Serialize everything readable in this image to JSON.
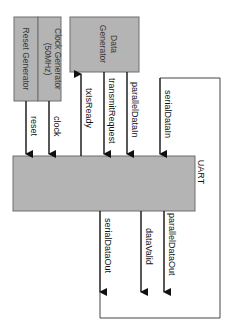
{
  "diagram": {
    "type": "block-diagram",
    "orientation": "rotated 90 degrees clockwise",
    "colors": {
      "block_fill": "#b4b4b4",
      "block_border": "#6e6e6e",
      "wire": "#111111",
      "background": "#ffffff"
    },
    "blocks": {
      "reset_generator": "Reset Generator",
      "clock_generator_line1": "Clock Generator",
      "clock_generator_line2": "(50MHz)",
      "data_generator_line1": "Data",
      "data_generator_line2": "Generator",
      "uart": "UART"
    },
    "signals": {
      "reset": "reset",
      "clock": "clock",
      "tx_is_ready": "txIsReady",
      "transmit_request": "transmitRequest",
      "parallel_data_in": "parallelDataIn",
      "serial_data_in": "serialDataIn",
      "serial_data_out": "serialDataOut",
      "data_valid": "dataValid",
      "parallel_data_out": "parallelDataOut"
    },
    "connections": [
      {
        "from": "Reset Generator",
        "to": "UART",
        "signal": "reset"
      },
      {
        "from": "Clock Generator (50MHz)",
        "to": "UART",
        "signal": "clock"
      },
      {
        "from": "UART",
        "to": "Data Generator",
        "signal": "txIsReady"
      },
      {
        "from": "Data Generator",
        "to": "UART",
        "signal": "transmitRequest"
      },
      {
        "from": "Data Generator",
        "to": "UART",
        "signal": "parallelDataIn"
      },
      {
        "from": "UART",
        "to": "UART",
        "signal": "serialDataOut -> serialDataIn (loopback)"
      },
      {
        "from": "UART",
        "to": "output",
        "signal": "dataValid"
      },
      {
        "from": "UART",
        "to": "output",
        "signal": "parallelDataOut"
      }
    ]
  }
}
